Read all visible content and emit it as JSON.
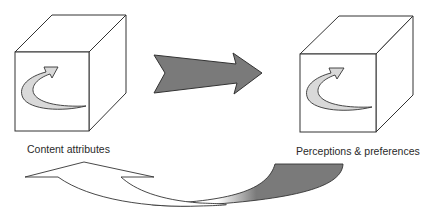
{
  "diagram": {
    "left_node": {
      "label": "Content attributes",
      "icon": "cube-with-curved-arrow-icon"
    },
    "right_node": {
      "label": "Perceptions & preferences",
      "icon": "cube-with-curved-arrow-icon"
    },
    "forward_arrow": {
      "direction": "left-to-right",
      "from": "Content attributes",
      "to": "Perceptions & preferences",
      "fill": "#7a7a7a"
    },
    "feedback_arrow": {
      "direction": "right-to-left",
      "from": "Perceptions & preferences",
      "to": "Content attributes",
      "tail_fill": "#7a7a7a",
      "head_fill": "#ffffff"
    },
    "colors": {
      "stroke": "#333333",
      "cube_face": "#ffffff",
      "inner_arrow_fill": "#d9d9d9",
      "dark_arrow_fill": "#7a7a7a"
    }
  }
}
